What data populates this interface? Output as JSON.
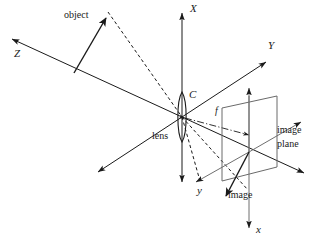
{
  "figure": {
    "background_color": "#ffffff",
    "line_color": "#1a1a1a",
    "width": 315,
    "height": 243
  },
  "labels": {
    "world_axis_x": "X",
    "world_axis_y": "Y",
    "world_axis_z": "Z",
    "image_axis_x": "x",
    "image_axis_y": "y",
    "optical_center": "C",
    "focal_length": "f",
    "object": "object",
    "lens": "lens",
    "image": "image",
    "image_plane_line1": "image",
    "image_plane_line2": "plane"
  },
  "elements": {
    "object_arrow": "object-vector-arrow",
    "image_arrow": "image-vector-arrow",
    "lens_shape": "biconvex-lens",
    "image_plane_shape": "image-plane-parallelogram",
    "projection_rays": "dashed-projection-rays",
    "focal_marker": "dash-dot-focal-length-marker"
  }
}
